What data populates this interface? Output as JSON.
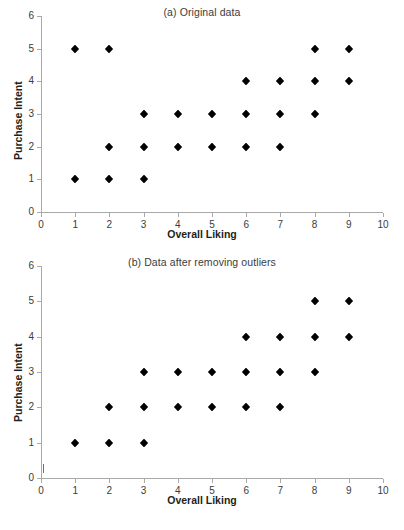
{
  "figure": {
    "marker_color": "#000000",
    "axis_color": "#a9a9a9",
    "text_color": "#231f20"
  },
  "chart_data": [
    {
      "type": "scatter",
      "title": "(a) Original data",
      "xlabel": "Overall Liking",
      "ylabel": "Purchase Intent",
      "xlim": [
        0,
        10
      ],
      "ylim": [
        0,
        6
      ],
      "xticks": [
        0,
        1,
        2,
        3,
        4,
        5,
        6,
        7,
        8,
        9,
        10
      ],
      "yticks": [
        0,
        1,
        2,
        3,
        4,
        5,
        6
      ],
      "xticklabels": [
        "0",
        "1",
        "2",
        "3",
        "4",
        "5",
        "6",
        "7",
        "8",
        "9",
        "10"
      ],
      "yticklabels": [
        "0",
        "1",
        "2",
        "3",
        "4",
        "5",
        "6"
      ],
      "grid": false,
      "legend": false,
      "marker": "diamond",
      "points": [
        {
          "x": 1,
          "y": 5
        },
        {
          "x": 2,
          "y": 5
        },
        {
          "x": 8,
          "y": 5
        },
        {
          "x": 9,
          "y": 5
        },
        {
          "x": 6,
          "y": 4
        },
        {
          "x": 7,
          "y": 4
        },
        {
          "x": 8,
          "y": 4
        },
        {
          "x": 9,
          "y": 4
        },
        {
          "x": 3,
          "y": 3
        },
        {
          "x": 4,
          "y": 3
        },
        {
          "x": 5,
          "y": 3
        },
        {
          "x": 6,
          "y": 3
        },
        {
          "x": 7,
          "y": 3
        },
        {
          "x": 8,
          "y": 3
        },
        {
          "x": 2,
          "y": 2
        },
        {
          "x": 3,
          "y": 2
        },
        {
          "x": 4,
          "y": 2
        },
        {
          "x": 5,
          "y": 2
        },
        {
          "x": 6,
          "y": 2
        },
        {
          "x": 7,
          "y": 2
        },
        {
          "x": 1,
          "y": 1
        },
        {
          "x": 2,
          "y": 1
        },
        {
          "x": 3,
          "y": 1
        }
      ]
    },
    {
      "type": "scatter",
      "title": "(b) Data after removing outliers",
      "xlabel": "Overall Liking",
      "ylabel": "Purchase Intent",
      "xlim": [
        0,
        10
      ],
      "ylim": [
        0,
        6
      ],
      "xticks": [
        0,
        1,
        2,
        3,
        4,
        5,
        6,
        7,
        8,
        9,
        10
      ],
      "yticks": [
        0,
        1,
        2,
        3,
        4,
        5,
        6
      ],
      "xticklabels": [
        "0",
        "1",
        "2",
        "3",
        "4",
        "5",
        "6",
        "7",
        "8",
        "9",
        "10"
      ],
      "yticklabels": [
        "0",
        "1",
        "2",
        "3",
        "4",
        "5",
        "6"
      ],
      "grid": false,
      "legend": false,
      "marker": "diamond",
      "points": [
        {
          "x": 8,
          "y": 5
        },
        {
          "x": 9,
          "y": 5
        },
        {
          "x": 6,
          "y": 4
        },
        {
          "x": 7,
          "y": 4
        },
        {
          "x": 8,
          "y": 4
        },
        {
          "x": 9,
          "y": 4
        },
        {
          "x": 3,
          "y": 3
        },
        {
          "x": 4,
          "y": 3
        },
        {
          "x": 5,
          "y": 3
        },
        {
          "x": 6,
          "y": 3
        },
        {
          "x": 7,
          "y": 3
        },
        {
          "x": 8,
          "y": 3
        },
        {
          "x": 2,
          "y": 2
        },
        {
          "x": 3,
          "y": 2
        },
        {
          "x": 4,
          "y": 2
        },
        {
          "x": 5,
          "y": 2
        },
        {
          "x": 6,
          "y": 2
        },
        {
          "x": 7,
          "y": 2
        },
        {
          "x": 1,
          "y": 1
        },
        {
          "x": 2,
          "y": 1
        },
        {
          "x": 3,
          "y": 1
        }
      ]
    }
  ]
}
